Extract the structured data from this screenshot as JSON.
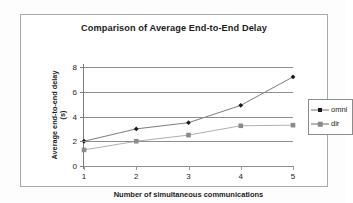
{
  "figure": {
    "background_color": "#ffffff",
    "frame_color": "#a9a9a9"
  },
  "chart_data": {
    "type": "line",
    "title": "Comparison of Average End-to-End Delay",
    "xlabel": "Number of simultaneous communications",
    "ylabel": "Average end-to-end delay (s)",
    "ylabel_line1": "Average end-to-end delay",
    "ylabel_line2": "(s)",
    "x": [
      1,
      2,
      3,
      4,
      5
    ],
    "categories": [
      "1",
      "2",
      "3",
      "4",
      "5"
    ],
    "xtick_labels": [
      "1",
      "2",
      "3",
      "4",
      "5"
    ],
    "ytick_labels": [
      "0",
      "2",
      "4",
      "6",
      "8"
    ],
    "yticks": [
      0,
      2,
      4,
      6,
      8
    ],
    "xlim": [
      1,
      5
    ],
    "ylim": [
      0,
      8
    ],
    "grid": "horizontal",
    "legend_position": "right",
    "series": [
      {
        "name": "omni",
        "marker": "diamond",
        "color": "#1a1a1a",
        "line_color": "#6d6d6d",
        "values": [
          2.0,
          3.0,
          3.5,
          4.9,
          7.2
        ]
      },
      {
        "name": "dir",
        "marker": "square",
        "color": "#8a8a8a",
        "line_color": "#a6a6a6",
        "values": [
          1.3,
          2.0,
          2.5,
          3.25,
          3.3
        ]
      }
    ]
  },
  "legend": {
    "entries": [
      {
        "label": "omni"
      },
      {
        "label": "dir"
      }
    ]
  }
}
